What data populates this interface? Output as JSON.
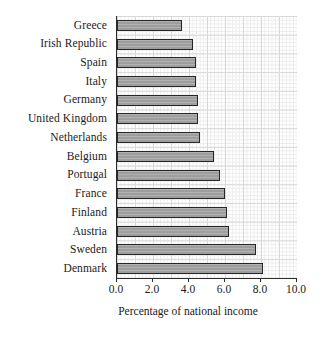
{
  "chart_data": {
    "type": "bar",
    "orientation": "horizontal",
    "title": "",
    "xlabel": "Percentage of national income",
    "ylabel": "",
    "xlim": [
      0.0,
      10.0
    ],
    "xticks": [
      "0.0",
      "2.0",
      "4.0",
      "6.0",
      "8.0",
      "10.0"
    ],
    "xtick_values": [
      0.0,
      2.0,
      4.0,
      6.0,
      8.0,
      10.0
    ],
    "grid": true,
    "legend": false,
    "categories": [
      "Greece",
      "Irish Republic",
      "Spain",
      "Italy",
      "Germany",
      "United Kingdom",
      "Netherlands",
      "Belgium",
      "Portugal",
      "France",
      "Finland",
      "Austria",
      "Sweden",
      "Denmark"
    ],
    "values": [
      3.6,
      4.2,
      4.4,
      4.4,
      4.5,
      4.5,
      4.6,
      5.4,
      5.7,
      6.0,
      6.1,
      6.2,
      7.7,
      8.1
    ],
    "bar_fill_color": "#9d9d9d",
    "bar_edge_color": "#262626",
    "grid_color": "#d8d8d8",
    "axis_color": "#2b2b2b",
    "background_color": "#ffffff"
  }
}
